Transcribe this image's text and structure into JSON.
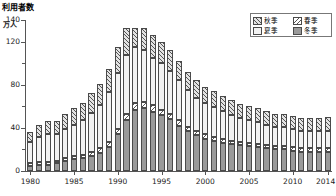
{
  "chart_data": {
    "type": "bar",
    "stacked": true,
    "title": "利用者数",
    "ylabel": "万人",
    "xlabel": "年",
    "ylim": [
      0,
      140
    ],
    "yticks": [
      0,
      40,
      80,
      120,
      140
    ],
    "ytick_labels": [
      "0",
      "40",
      "80",
      "120",
      "140"
    ],
    "yminor_ticks": [
      20,
      60,
      100
    ],
    "grid": false,
    "legend_position": "top-right",
    "categories": [
      "1980",
      "1981",
      "1982",
      "1983",
      "1984",
      "1985",
      "1986",
      "1987",
      "1988",
      "1989",
      "1990",
      "1991",
      "1992",
      "1993",
      "1994",
      "1995",
      "1996",
      "1997",
      "1998",
      "1999",
      "2000",
      "2001",
      "2002",
      "2003",
      "2004",
      "2005",
      "2006",
      "2007",
      "2008",
      "2009",
      "2010",
      "2011",
      "2012",
      "2013",
      "2014"
    ],
    "series": [
      {
        "name": "冬季",
        "key": "winter",
        "pattern": "solid-gray",
        "values": [
          5,
          6,
          6,
          7,
          9,
          11,
          12,
          14,
          17,
          22,
          34,
          47,
          57,
          58,
          55,
          52,
          48,
          42,
          37,
          33,
          30,
          28,
          26,
          25,
          24,
          23,
          22,
          21,
          20,
          20,
          19,
          18,
          18,
          18,
          18
        ]
      },
      {
        "name": "春季",
        "key": "spring",
        "pattern": "hatch-backslash",
        "values": [
          2,
          2,
          2,
          2,
          3,
          3,
          3,
          4,
          4,
          5,
          5,
          6,
          6,
          6,
          6,
          5,
          5,
          5,
          4,
          4,
          4,
          4,
          4,
          3,
          3,
          3,
          3,
          3,
          3,
          3,
          3,
          3,
          3,
          3,
          3
        ]
      },
      {
        "name": "夏季",
        "key": "summer",
        "pattern": "light-plain",
        "values": [
          20,
          24,
          26,
          25,
          27,
          29,
          32,
          36,
          40,
          46,
          52,
          55,
          52,
          48,
          44,
          43,
          40,
          37,
          34,
          31,
          29,
          27,
          26,
          24,
          22,
          21,
          20,
          19,
          18,
          18,
          17,
          16,
          16,
          16,
          16
        ]
      },
      {
        "name": "秋季",
        "key": "autumn",
        "pattern": "hatch-slash",
        "values": [
          9,
          11,
          12,
          12,
          14,
          15,
          16,
          18,
          20,
          22,
          24,
          25,
          18,
          21,
          21,
          20,
          19,
          18,
          17,
          16,
          15,
          15,
          14,
          14,
          13,
          13,
          13,
          13,
          12,
          12,
          12,
          12,
          12,
          12,
          13
        ]
      }
    ]
  }
}
